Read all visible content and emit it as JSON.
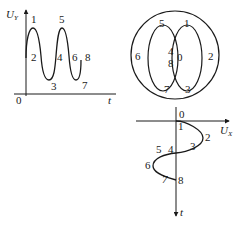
{
  "panels": {
    "time_plot_y": {
      "axis_y_label": "U",
      "axis_y_sub": "Y",
      "axis_x_label": "t",
      "origin_label": "0",
      "point_labels": [
        "1",
        "2",
        "3",
        "4",
        "5",
        "6",
        "7",
        "8"
      ]
    },
    "circle_diagram": {
      "outer_labels": [
        "5",
        "1",
        "6",
        "2",
        "7",
        "3"
      ],
      "center_labels": [
        "4",
        "8",
        "0"
      ],
      "labels": {
        "p0": "0",
        "p1": "1",
        "p2": "2",
        "p3": "3",
        "p4": "4",
        "p5": "5",
        "p6": "6",
        "p7": "7",
        "p8": "8"
      }
    },
    "time_plot_x": {
      "axis_x_label": "U",
      "axis_x_sub": "X",
      "axis_t_label": "t",
      "origin_label": "0",
      "labels": {
        "p1": "1",
        "p2": "2",
        "p3": "3",
        "p4": "4",
        "p5": "5",
        "p6": "6",
        "p7": "7",
        "p8": "8"
      }
    }
  },
  "colors": {
    "stroke": "#1a1a1a",
    "background": "#ffffff"
  }
}
